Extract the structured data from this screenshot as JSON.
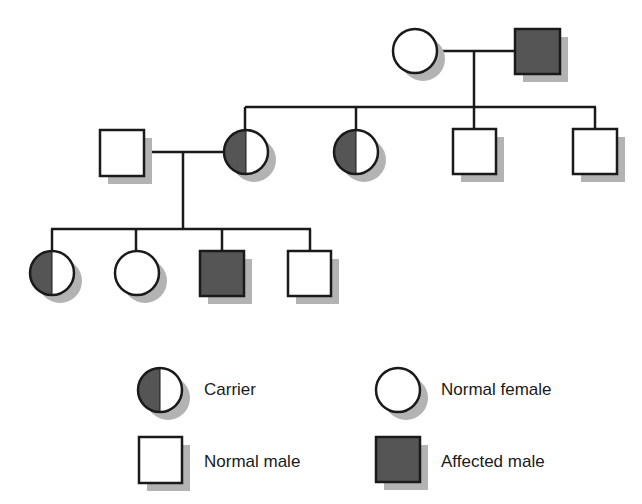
{
  "diagram": {
    "type": "pedigree",
    "colors": {
      "line": "#1a1a1a",
      "affected_fill": "#555555",
      "unaffected_fill": "#ffffff",
      "shadow": "#b3b3b3"
    },
    "generations": [
      {
        "id": "I",
        "individuals": [
          {
            "id": "I-1",
            "sex": "female",
            "status": "normal"
          },
          {
            "id": "I-2",
            "sex": "male",
            "status": "affected"
          }
        ]
      },
      {
        "id": "II",
        "individuals": [
          {
            "id": "II-spouse",
            "sex": "male",
            "status": "normal"
          },
          {
            "id": "II-1",
            "sex": "female",
            "status": "carrier"
          },
          {
            "id": "II-2",
            "sex": "female",
            "status": "carrier"
          },
          {
            "id": "II-3",
            "sex": "male",
            "status": "normal"
          },
          {
            "id": "II-4",
            "sex": "male",
            "status": "normal"
          }
        ]
      },
      {
        "id": "III",
        "individuals": [
          {
            "id": "III-1",
            "sex": "female",
            "status": "carrier"
          },
          {
            "id": "III-2",
            "sex": "female",
            "status": "normal"
          },
          {
            "id": "III-3",
            "sex": "male",
            "status": "affected"
          },
          {
            "id": "III-4",
            "sex": "male",
            "status": "normal"
          }
        ]
      }
    ]
  },
  "legend": {
    "items": [
      {
        "symbol": "carrier-female",
        "label": "Carrier"
      },
      {
        "symbol": "normal-female",
        "label": "Normal female"
      },
      {
        "symbol": "normal-male",
        "label": "Normal male"
      },
      {
        "symbol": "affected-male",
        "label": "Affected male"
      }
    ]
  }
}
